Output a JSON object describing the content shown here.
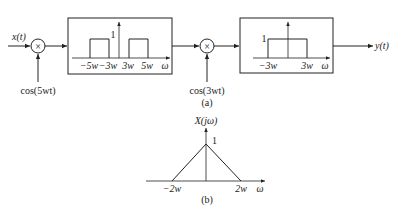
{
  "diagram_a": {
    "caption": "(a)",
    "input_label": "x(t)",
    "output_label": "y(t)",
    "multiplier1": {
      "symbol": "×",
      "carrier": "cos(5wt)"
    },
    "filter1": {
      "type": "bandpass",
      "gain_label": "1",
      "ticks": [
        "−5w",
        "−3w",
        "3w",
        "5w"
      ],
      "axis_label": "ω"
    },
    "multiplier2": {
      "symbol": "×",
      "carrier": "cos(3wt)"
    },
    "filter2": {
      "type": "lowpass",
      "gain_label": "1",
      "ticks": [
        "−3w",
        "3w"
      ],
      "axis_label": "ω"
    }
  },
  "diagram_b": {
    "caption": "(b)",
    "y_label": "X(jω)",
    "peak_label": "1",
    "ticks": [
      "−2w",
      "2w"
    ],
    "axis_label": "ω"
  }
}
